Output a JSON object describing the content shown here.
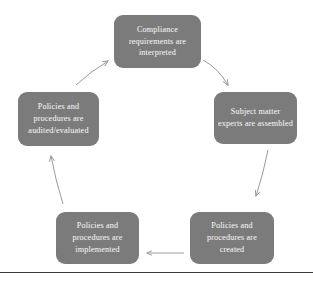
{
  "diagram": {
    "type": "cycle",
    "title": "",
    "node_fill_color": "#7b7b7b",
    "node_text_color": "#efefef",
    "arrow_color": "#9a9a9a",
    "rule_color": "#3a3a3a",
    "nodes": [
      {
        "id": "interpreted",
        "label": "Compliance requirements are interpreted",
        "position": "top"
      },
      {
        "id": "experts",
        "label": "Subject matter experts are assembled",
        "position": "right"
      },
      {
        "id": "created",
        "label": "Policies and procedures are created",
        "position": "bottom-right"
      },
      {
        "id": "implemented",
        "label": "Policies and procedures are implemented",
        "position": "bottom-left"
      },
      {
        "id": "audited",
        "label": "Policies and procedures are audited/evaluated",
        "position": "left"
      }
    ],
    "arrows": [
      {
        "id": "interpreted-to-experts",
        "from": "interpreted",
        "to": "experts"
      },
      {
        "id": "experts-to-created",
        "from": "experts",
        "to": "created"
      },
      {
        "id": "created-to-implemented",
        "from": "created",
        "to": "implemented"
      },
      {
        "id": "implemented-to-audited",
        "from": "implemented",
        "to": "audited"
      },
      {
        "id": "audited-to-interpreted",
        "from": "audited",
        "to": "interpreted"
      }
    ]
  }
}
